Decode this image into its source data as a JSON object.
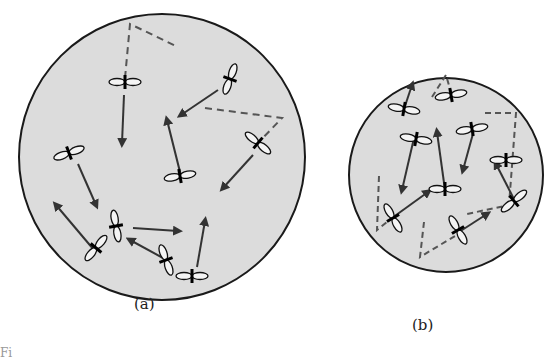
{
  "figure": {
    "panels": [
      {
        "id": "a",
        "label": "(a)",
        "description": "Larger container: molecules with randomly oriented p-orbital-like lobes moving with velocity arrows; dashed lines show wall-bounce trajectories",
        "circle": {
          "cx": 162,
          "cy": 157,
          "r": 143
        },
        "molecule_count": 10
      },
      {
        "id": "b",
        "label": "(b)",
        "description": "Smaller container with the same number of molecules, more frequent wall collisions shown by dashed trajectory segments",
        "circle": {
          "cx": 446,
          "cy": 175,
          "r": 97
        },
        "molecule_count": 10
      }
    ],
    "caption_fragment": "Fi",
    "colors": {
      "container_fill": "#dcdcdc",
      "outline": "#1a1a1a",
      "arrow": "#3a3a3a",
      "dashed": "#555555",
      "background": "#ffffff"
    }
  }
}
